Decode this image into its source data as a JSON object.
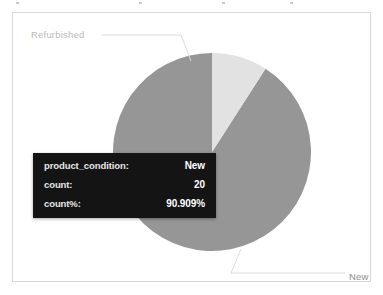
{
  "chart_data": {
    "type": "pie",
    "title": "",
    "categories": [
      "New",
      "Refurbished"
    ],
    "values": [
      20,
      2
    ],
    "percents": [
      90.909,
      9.091
    ],
    "labels": [
      "New",
      "Refurbished"
    ],
    "colors": [
      "#969696",
      "#e2e2e2"
    ],
    "legend": "none",
    "grid": false,
    "start_angle_deg": 0,
    "direction": "counterclockwise",
    "series": [
      {
        "name": "count",
        "values": [
          20,
          2
        ]
      }
    ]
  },
  "panel": {
    "border_color": "#d7d7d7",
    "background": "#ffffff"
  },
  "slice_labels": {
    "refurbished": "Refurbished",
    "new": "New"
  },
  "tooltip": {
    "background": "#141414",
    "rows": [
      {
        "key": "product_condition:",
        "value": "New"
      },
      {
        "key": "count:",
        "value": "20"
      },
      {
        "key": "count%:",
        "value": "90.909%"
      }
    ]
  }
}
